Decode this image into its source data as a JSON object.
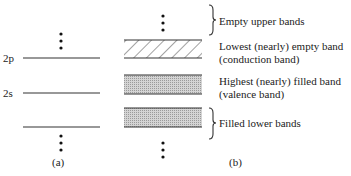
{
  "panel_a": {
    "caption": "(a)",
    "levels": [
      {
        "label": "2p",
        "y": 58
      },
      {
        "label": "2s",
        "y": 93
      },
      {
        "label": "",
        "y": 127
      }
    ]
  },
  "panel_b": {
    "caption": "(b)",
    "bands": [
      {
        "name": "conduction-band",
        "fill": "hatched",
        "y_top": 40,
        "y_bottom": 58
      },
      {
        "name": "valence-band",
        "fill": "dotted",
        "y_top": 75,
        "y_bottom": 94
      },
      {
        "name": "filled-lower-band",
        "fill": "dotted",
        "y_top": 108,
        "y_bottom": 127
      }
    ],
    "annotations": {
      "empty_upper": "Empty upper bands",
      "conduction_line1": "Lowest (nearly) empty band",
      "conduction_line2": "(conduction band)",
      "valence_line1": "Highest (nearly) filled band",
      "valence_line2": "(valence band)",
      "filled_lower": "Filled lower bands"
    }
  },
  "colors": {
    "line": "#333333",
    "band_fill": "#c9c9c9",
    "hatch": "#444444"
  }
}
